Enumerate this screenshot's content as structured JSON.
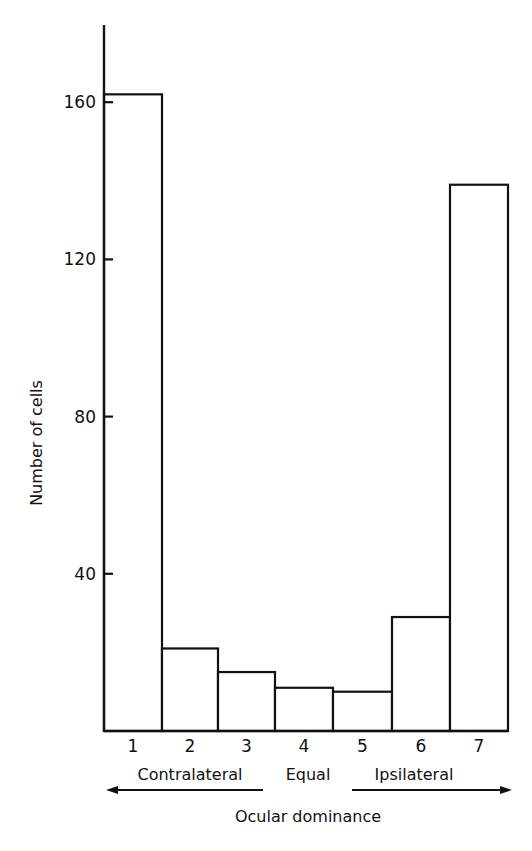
{
  "chart_data": {
    "type": "bar",
    "title": "",
    "xlabel": "Ocular dominance",
    "ylabel": "Number of cells",
    "categories": [
      "1",
      "2",
      "3",
      "4",
      "5",
      "6",
      "7"
    ],
    "values": [
      162,
      21,
      15,
      11,
      10,
      29,
      139
    ],
    "ylim": [
      0,
      180
    ],
    "yticks": [
      40,
      80,
      120,
      160
    ],
    "grid": false,
    "legend": null,
    "annotations": {
      "left_group": "Contralateral",
      "middle_group": "Equal",
      "right_group": "Ipsilateral",
      "left_arrow": "pointing left under Contralateral",
      "right_arrow": "pointing right under Ipsilateral"
    }
  },
  "labels": {
    "ylabel": "Number of cells",
    "xlabel": "Ocular dominance",
    "contralateral": "Contralateral",
    "equal": "Equal",
    "ipsilateral": "Ipsilateral",
    "yticks": [
      "40",
      "80",
      "120",
      "160"
    ],
    "xticks": [
      "1",
      "2",
      "3",
      "4",
      "5",
      "6",
      "7"
    ]
  },
  "colors": {
    "stroke": "#111111",
    "background": "#ffffff",
    "bar_fill": "#ffffff"
  }
}
